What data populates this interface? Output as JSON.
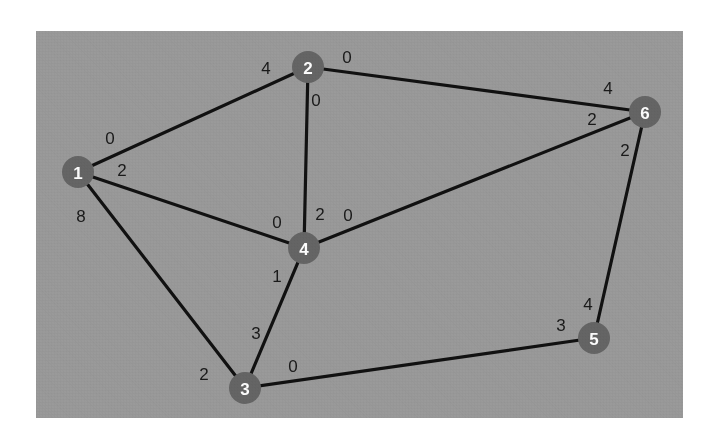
{
  "figure": {
    "background_color": "#ffffff",
    "panel_color": "#9a9a9a",
    "node_color": "#656565",
    "node_label_color": "#ffffff",
    "edge_color": "#111111",
    "edge_label_color": "#1a1a1a",
    "panel": {
      "x": 36,
      "y": 31,
      "width": 647,
      "height": 387
    }
  },
  "chart_data": {
    "type": "diagram",
    "diagram_kind": "weighted-graph",
    "node_radius": 16,
    "nodes": [
      {
        "id": "1",
        "label": "1",
        "x": 78,
        "y": 172
      },
      {
        "id": "2",
        "label": "2",
        "x": 308,
        "y": 67
      },
      {
        "id": "3",
        "label": "3",
        "x": 245,
        "y": 388
      },
      {
        "id": "4",
        "label": "4",
        "x": 304,
        "y": 248
      },
      {
        "id": "5",
        "label": "5",
        "x": 594,
        "y": 338
      },
      {
        "id": "6",
        "label": "6",
        "x": 645,
        "y": 112
      }
    ],
    "edges": [
      {
        "id": "e-1-2",
        "source": "1",
        "target": "2",
        "source_label": "0",
        "target_label": "4",
        "source_label_x": 110,
        "source_label_y": 138,
        "target_label_x": 266,
        "target_label_y": 68
      },
      {
        "id": "e-1-4",
        "source": "1",
        "target": "4",
        "source_label": "2",
        "target_label": "0",
        "source_label_x": 122,
        "source_label_y": 170,
        "target_label_x": 277,
        "target_label_y": 222
      },
      {
        "id": "e-1-3",
        "source": "1",
        "target": "3",
        "source_label": "8",
        "target_label": "2",
        "source_label_x": 81,
        "source_label_y": 216,
        "target_label_x": 204,
        "target_label_y": 374
      },
      {
        "id": "e-2-4",
        "source": "2",
        "target": "4",
        "source_label": "0",
        "target_label": "2",
        "source_label_x": 316,
        "source_label_y": 100,
        "target_label_x": 320,
        "target_label_y": 214
      },
      {
        "id": "e-2-6",
        "source": "2",
        "target": "6",
        "source_label": "0",
        "target_label": "4",
        "source_label_x": 347,
        "source_label_y": 57,
        "target_label_x": 608,
        "target_label_y": 88
      },
      {
        "id": "e-4-6",
        "source": "4",
        "target": "6",
        "source_label": "0",
        "target_label": "2",
        "source_label_x": 348,
        "source_label_y": 215,
        "target_label_x": 592,
        "target_label_y": 119
      },
      {
        "id": "e-3-4",
        "source": "3",
        "target": "4",
        "source_label": "3",
        "target_label": "1",
        "source_label_x": 256,
        "source_label_y": 333,
        "target_label_x": 277,
        "target_label_y": 276
      },
      {
        "id": "e-3-5",
        "source": "3",
        "target": "5",
        "source_label": "0",
        "target_label": "3",
        "source_label_x": 293,
        "source_label_y": 366,
        "target_label_x": 561,
        "target_label_y": 325
      },
      {
        "id": "e-5-6",
        "source": "5",
        "target": "6",
        "source_label": "4",
        "target_label": "2",
        "source_label_x": 588,
        "source_label_y": 304,
        "target_label_x": 625,
        "target_label_y": 150
      }
    ],
    "edge_list_readable": [
      "1-2 (0, 4)",
      "1-4 (2, 0)",
      "1-3 (8, 2)",
      "2-4 (0, 2)",
      "2-6 (0, 4)",
      "4-6 (0, 2)",
      "3-4 (3, 1)",
      "3-5 (0, 3)",
      "5-6 (4, 2)"
    ]
  }
}
